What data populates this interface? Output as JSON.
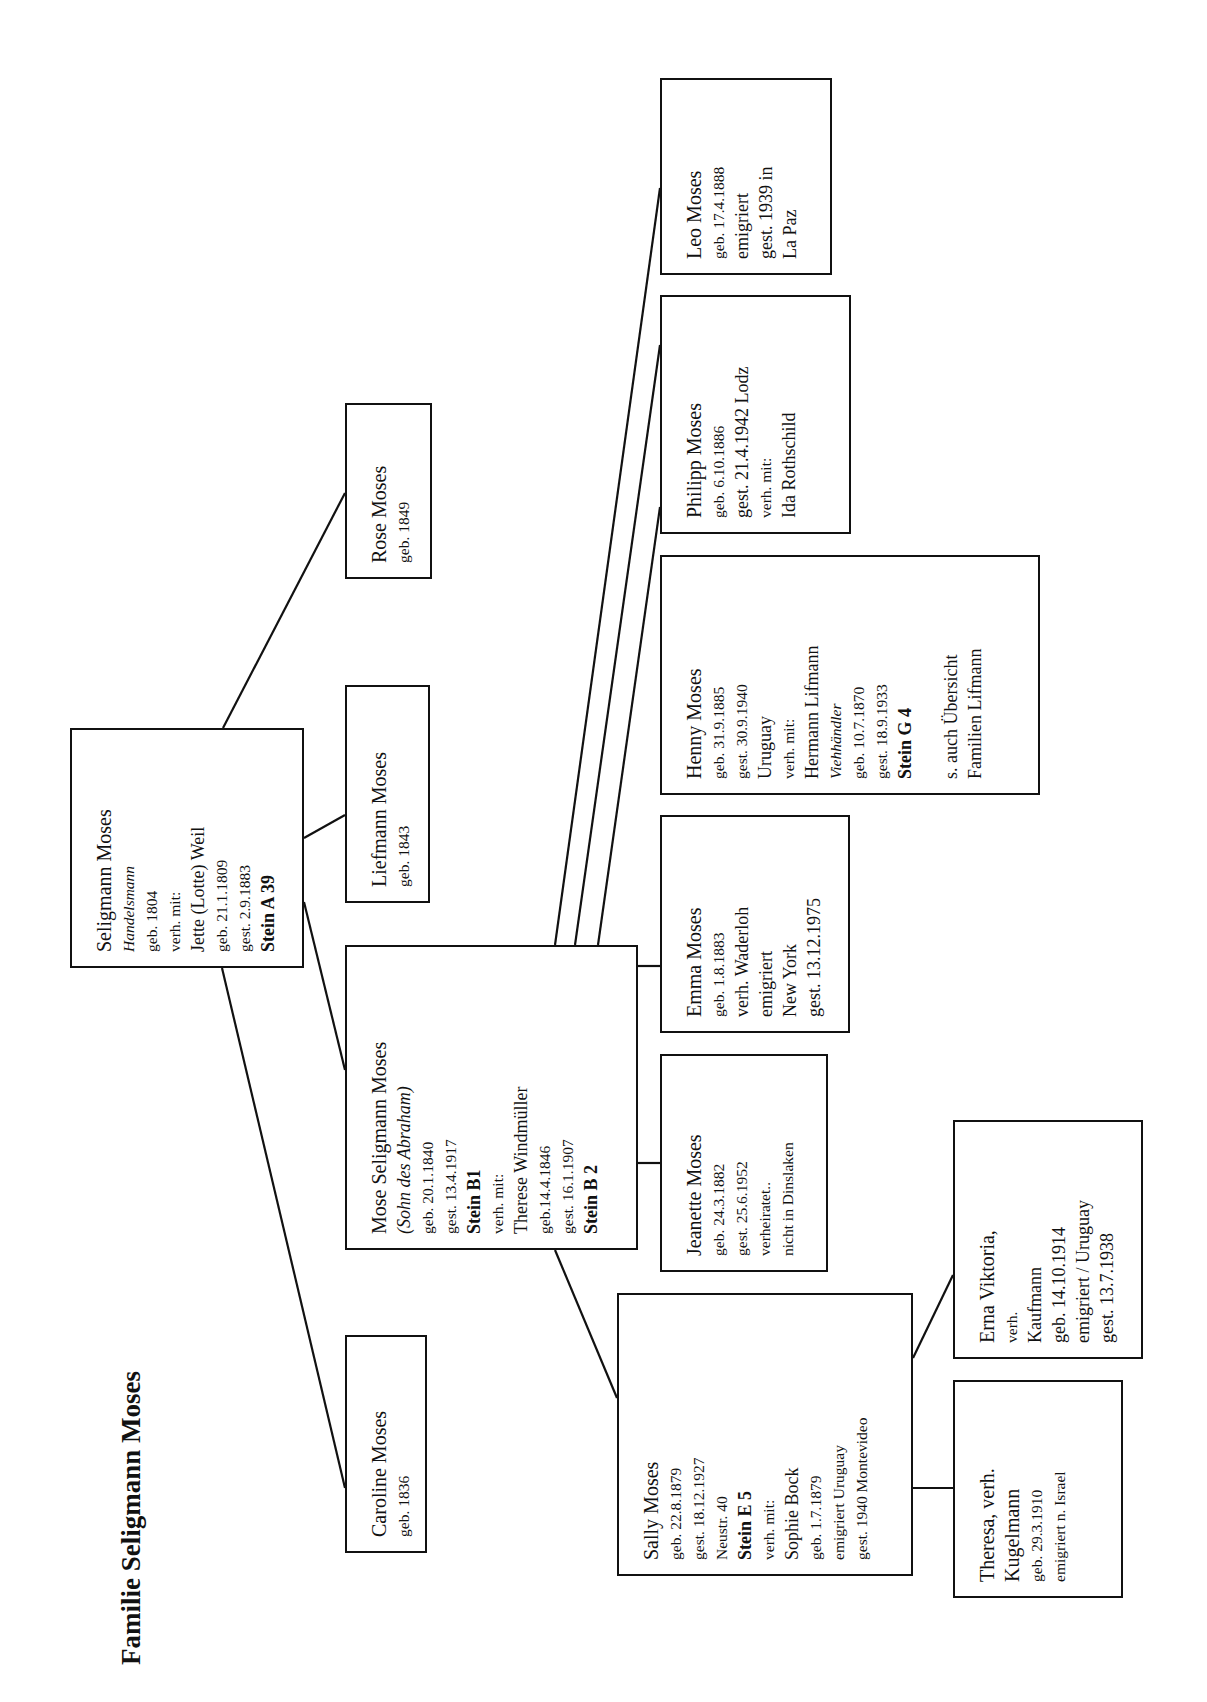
{
  "title": "Familie Seligmann Moses",
  "colors": {
    "ink": "#111111",
    "paper": "#ffffff"
  },
  "people": {
    "seligmann": {
      "lines": [
        "Seligmann Moses",
        "Handelsmann",
        "geb. 1804",
        "verh. mit:",
        "Jette (Lotte) Weil",
        "geb. 21.1.1809",
        "gest. 2.9.1883",
        "Stein A 39"
      ]
    },
    "rose": {
      "lines": [
        "Rose Moses",
        "geb. 1849"
      ]
    },
    "liefmann": {
      "lines": [
        "Liefmann Moses",
        "geb. 1843"
      ]
    },
    "caroline": {
      "lines": [
        "Caroline Moses",
        "geb. 1836"
      ]
    },
    "mose": {
      "lines": [
        "Mose Seligmann Moses",
        "(Sohn des Abraham)",
        "geb. 20.1.1840",
        "gest. 13.4.1917",
        "Stein  B1",
        "verh. mit:",
        "Therese Windmüller",
        "geb.14.4.1846",
        "gest. 16.1.1907",
        "Stein  B 2"
      ]
    },
    "leo": {
      "lines": [
        "Leo Moses",
        "geb. 17.4.1888",
        "emigriert",
        "gest. 1939 in",
        "La Paz"
      ]
    },
    "philipp": {
      "lines": [
        "Philipp Moses",
        "geb. 6.10.1886",
        "gest. 21.4.1942  Lodz",
        "verh. mit:",
        "Ida Rothschild"
      ]
    },
    "henny": {
      "lines": [
        "Henny Moses",
        "geb. 31.9.1885",
        "gest. 30.9.1940",
        "Uruguay",
        "verh. mit:",
        "Hermann Lifmann",
        "Viehhändler",
        "geb. 10.7.1870",
        "gest. 18.9.1933",
        "Stein G 4",
        "s. auch Übersicht",
        "Familien  Lifmann"
      ]
    },
    "emma": {
      "lines": [
        "Emma Moses",
        "geb. 1.8.1883",
        "verh. Waderloh",
        "emigriert",
        "New York",
        "gest. 13.12.1975"
      ]
    },
    "jeanette": {
      "lines": [
        "Jeanette Moses",
        "geb. 24.3.1882",
        "gest. 25.6.1952",
        "verheiratet..",
        "nicht in Dinslaken"
      ]
    },
    "sally": {
      "lines": [
        "Sally Moses",
        "geb. 22.8.1879",
        "gest. 18.12.1927",
        "Neustr. 40",
        "Stein E 5",
        "verh. mit:",
        "Sophie Bock",
        "geb. 1.7.1879",
        "emigriert Uruguay",
        "gest. 1940 Montevideo"
      ]
    },
    "erna": {
      "lines": [
        "Erna Viktoria,",
        "verh.",
        "Kaufmann",
        "geb. 14.10.1914",
        "emigriert / Uruguay",
        "gest. 13.7.1938"
      ]
    },
    "theresa": {
      "lines": [
        "Theresa, verh.",
        "Kugelmann",
        "geb. 29.3.1910",
        "emigriert n. Israel"
      ]
    }
  }
}
